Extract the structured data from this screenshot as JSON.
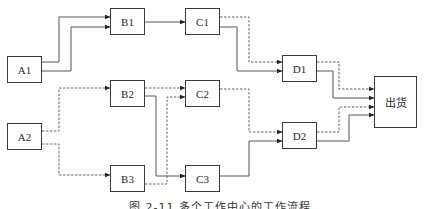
{
  "diagram": {
    "nodes": {
      "A1": {
        "label": "A1"
      },
      "A2": {
        "label": "A2"
      },
      "B1": {
        "label": "B1"
      },
      "B2": {
        "label": "B2"
      },
      "B3": {
        "label": "B3"
      },
      "C1": {
        "label": "C1"
      },
      "C2": {
        "label": "C2"
      },
      "C3": {
        "label": "C3"
      },
      "D1": {
        "label": "D1"
      },
      "D2": {
        "label": "D2"
      },
      "ship": {
        "label": "出货"
      }
    },
    "edges": [
      {
        "from": "A1",
        "to": "B1",
        "style": "solid"
      },
      {
        "from": "A1",
        "to": "B1",
        "style": "solid"
      },
      {
        "from": "A2",
        "to": "B2",
        "style": "dashed"
      },
      {
        "from": "A2",
        "to": "B3",
        "style": "dashed"
      },
      {
        "from": "B1",
        "to": "C1",
        "style": "solid"
      },
      {
        "from": "B2",
        "to": "C2",
        "style": "dashed"
      },
      {
        "from": "B2",
        "to": "C3",
        "style": "solid"
      },
      {
        "from": "B3",
        "to": "C2",
        "style": "dashed"
      },
      {
        "from": "C1",
        "to": "D1",
        "style": "dashed"
      },
      {
        "from": "C1",
        "to": "D1",
        "style": "solid"
      },
      {
        "from": "C2",
        "to": "D2",
        "style": "dashed"
      },
      {
        "from": "C3",
        "to": "D2",
        "style": "solid"
      },
      {
        "from": "D1",
        "to": "ship",
        "style": "dashed"
      },
      {
        "from": "D1",
        "to": "ship",
        "style": "solid"
      },
      {
        "from": "D2",
        "to": "ship",
        "style": "dashed"
      },
      {
        "from": "D2",
        "to": "ship",
        "style": "solid"
      }
    ],
    "caption": "图 2-11  多个工作中心的工作流程"
  }
}
